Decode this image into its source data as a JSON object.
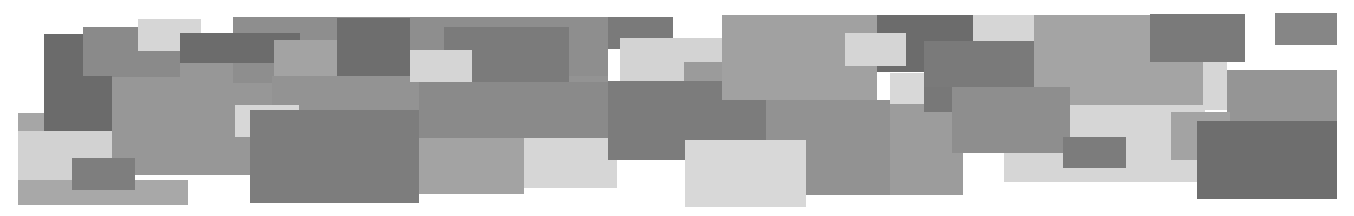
{
  "image": {
    "description": "Abstract composition of overlapping gray rectangles on white background",
    "width": 1354,
    "height": 216,
    "background": "#ffffff"
  },
  "rectangles": [
    {
      "x": 18,
      "y": 113,
      "w": 30,
      "h": 20,
      "color": "#a6a6a6"
    },
    {
      "x": 18,
      "y": 131,
      "w": 98,
      "h": 50,
      "color": "#d2d2d2"
    },
    {
      "x": 18,
      "y": 180,
      "w": 170,
      "h": 25,
      "color": "#a8a8a8"
    },
    {
      "x": 112,
      "y": 63,
      "w": 160,
      "h": 112,
      "color": "#979797"
    },
    {
      "x": 44,
      "y": 34,
      "w": 68,
      "h": 97,
      "color": "#6b6b6b"
    },
    {
      "x": 83,
      "y": 27,
      "w": 97,
      "h": 50,
      "color": "#8a8a8a"
    },
    {
      "x": 112,
      "y": 76,
      "w": 0,
      "h": 0,
      "color": "#6b6b6b"
    },
    {
      "x": 83,
      "y": 76,
      "w": 29,
      "h": 55,
      "color": "#6b6b6b"
    },
    {
      "x": 72,
      "y": 158,
      "w": 63,
      "h": 32,
      "color": "#7e7e7e"
    },
    {
      "x": 138,
      "y": 19,
      "w": 63,
      "h": 32,
      "color": "#d6d6d6"
    },
    {
      "x": 233,
      "y": 17,
      "w": 375,
      "h": 66,
      "color": "#8e8e8e"
    },
    {
      "x": 180,
      "y": 33,
      "w": 120,
      "h": 30,
      "color": "#6c6c6c"
    },
    {
      "x": 274,
      "y": 40,
      "w": 63,
      "h": 70,
      "color": "#a3a3a3"
    },
    {
      "x": 337,
      "y": 18,
      "w": 73,
      "h": 58,
      "color": "#6e6e6e"
    },
    {
      "x": 272,
      "y": 76,
      "w": 336,
      "h": 62,
      "color": "#939393"
    },
    {
      "x": 444,
      "y": 27,
      "w": 125,
      "h": 70,
      "color": "#7b7b7b"
    },
    {
      "x": 419,
      "y": 82,
      "w": 189,
      "h": 56,
      "color": "#8a8a8a"
    },
    {
      "x": 410,
      "y": 50,
      "w": 62,
      "h": 32,
      "color": "#d5d5d5"
    },
    {
      "x": 235,
      "y": 105,
      "w": 64,
      "h": 32,
      "color": "#d7d7d7"
    },
    {
      "x": 250,
      "y": 110,
      "w": 169,
      "h": 93,
      "color": "#7d7d7d"
    },
    {
      "x": 419,
      "y": 138,
      "w": 105,
      "h": 56,
      "color": "#a3a3a3"
    },
    {
      "x": 524,
      "y": 138,
      "w": 93,
      "h": 50,
      "color": "#d6d6d6"
    },
    {
      "x": 608,
      "y": 17,
      "w": 65,
      "h": 32,
      "color": "#7a7a7a"
    },
    {
      "x": 620,
      "y": 38,
      "w": 102,
      "h": 43,
      "color": "#d3d3d3"
    },
    {
      "x": 684,
      "y": 62,
      "w": 38,
      "h": 20,
      "color": "#9b9b9b"
    },
    {
      "x": 722,
      "y": 15,
      "w": 155,
      "h": 85,
      "color": "#a1a1a1"
    },
    {
      "x": 766,
      "y": 100,
      "w": 197,
      "h": 95,
      "color": "#929292"
    },
    {
      "x": 608,
      "y": 81,
      "w": 114,
      "h": 79,
      "color": "#7c7c7c"
    },
    {
      "x": 722,
      "y": 100,
      "w": 44,
      "h": 40,
      "color": "#7c7c7c"
    },
    {
      "x": 685,
      "y": 140,
      "w": 121,
      "h": 67,
      "color": "#d8d8d8"
    },
    {
      "x": 877,
      "y": 15,
      "w": 96,
      "h": 57,
      "color": "#6c6c6c"
    },
    {
      "x": 845,
      "y": 33,
      "w": 61,
      "h": 33,
      "color": "#d5d5d5"
    },
    {
      "x": 890,
      "y": 100,
      "w": 73,
      "h": 95,
      "color": "#9c9c9c"
    },
    {
      "x": 890,
      "y": 73,
      "w": 34,
      "h": 31,
      "color": "#d8d8d8"
    },
    {
      "x": 924,
      "y": 72,
      "w": 28,
      "h": 40,
      "color": "#787878"
    },
    {
      "x": 973,
      "y": 15,
      "w": 61,
      "h": 26,
      "color": "#d6d6d6"
    },
    {
      "x": 924,
      "y": 41,
      "w": 110,
      "h": 46,
      "color": "#7a7a7a"
    },
    {
      "x": 1034,
      "y": 15,
      "w": 169,
      "h": 90,
      "color": "#a4a4a4"
    },
    {
      "x": 952,
      "y": 87,
      "w": 118,
      "h": 66,
      "color": "#8e8e8e"
    },
    {
      "x": 1004,
      "y": 105,
      "w": 201,
      "h": 77,
      "color": "#d6d6d6"
    },
    {
      "x": 952,
      "y": 87,
      "w": 118,
      "h": 66,
      "color": "#8e8e8e"
    },
    {
      "x": 1063,
      "y": 137,
      "w": 63,
      "h": 31,
      "color": "#7c7c7c"
    },
    {
      "x": 1150,
      "y": 14,
      "w": 95,
      "h": 48,
      "color": "#7a7a7a"
    },
    {
      "x": 1203,
      "y": 62,
      "w": 24,
      "h": 48,
      "color": "#d6d6d6"
    },
    {
      "x": 1275,
      "y": 13,
      "w": 62,
      "h": 32,
      "color": "#868686"
    },
    {
      "x": 1227,
      "y": 70,
      "w": 110,
      "h": 52,
      "color": "#959595"
    },
    {
      "x": 1171,
      "y": 112,
      "w": 59,
      "h": 48,
      "color": "#a3a3a3"
    },
    {
      "x": 1197,
      "y": 121,
      "w": 140,
      "h": 78,
      "color": "#6e6e6e"
    }
  ]
}
